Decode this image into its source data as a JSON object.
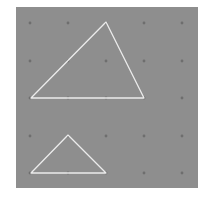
{
  "board": {
    "background": "#8e8e8e",
    "peg_color": "#6e6e6e",
    "band_color": "#ececec",
    "pegs": {
      "columns_x": [
        30,
        68,
        106,
        144,
        182
      ],
      "rows_y": [
        23,
        61,
        98,
        136,
        173
      ]
    }
  },
  "shapes": [
    {
      "name": "large-triangle",
      "points": [
        [
          106,
          22
        ],
        [
          31,
          98
        ],
        [
          144,
          98
        ]
      ]
    },
    {
      "name": "small-triangle",
      "points": [
        [
          68,
          135
        ],
        [
          31,
          173
        ],
        [
          106,
          173
        ]
      ]
    }
  ]
}
